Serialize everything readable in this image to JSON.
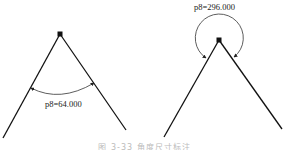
{
  "figures": [
    {
      "id": "left",
      "label": "p8=64.000",
      "angle_deg": 64.0,
      "dimension_side": "inner"
    },
    {
      "id": "right",
      "label": "p8=296.000",
      "angle_deg": 296.0,
      "dimension_side": "outer"
    }
  ],
  "caption": "图 3-33  角度尺寸标注"
}
